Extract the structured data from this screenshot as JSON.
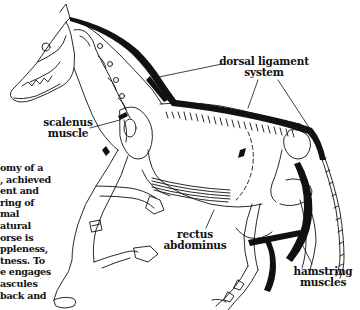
{
  "figure": {
    "colors": {
      "ink": "#111111",
      "background": "#ffffff"
    },
    "labels": {
      "dorsal_ligament": [
        "dorsal ligament",
        "system"
      ],
      "scalenus": [
        "scalenus",
        "muscle"
      ],
      "rectus": [
        "rectus",
        "abdominus"
      ],
      "hamstring": [
        "hamstring",
        "muscles"
      ]
    },
    "caption_lines": [
      "omy of a",
      ", achieved",
      "ent and",
      " ring of",
      "mal",
      "atural",
      "orse is",
      "ppleness,",
      "tness. To",
      "e engages",
      "ascules",
      "back and"
    ]
  }
}
